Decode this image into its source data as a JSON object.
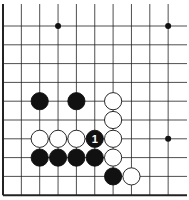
{
  "diagram": {
    "type": "go-board-fragment",
    "colors": {
      "background": "#ffffff",
      "line": "#222222",
      "black": "#111111",
      "white": "#ffffff"
    },
    "grid": {
      "x0": 3,
      "dx": 18.35,
      "cols": 10,
      "y0": 26,
      "dy": 18.8,
      "rows": 10,
      "h_line_extend_to": 187,
      "v_line_top": 4,
      "left_edge": true,
      "bottom_edge": true,
      "top_edge": false,
      "right_edge": false
    },
    "star_points": [
      [
        3,
        0
      ],
      [
        9,
        0
      ],
      [
        9,
        6
      ]
    ],
    "stones": [
      {
        "color": "black",
        "col": 2,
        "row": 4
      },
      {
        "color": "black",
        "col": 4,
        "row": 4
      },
      {
        "color": "white",
        "col": 6,
        "row": 4
      },
      {
        "color": "white",
        "col": 6,
        "row": 5
      },
      {
        "color": "white",
        "col": 2,
        "row": 6
      },
      {
        "color": "white",
        "col": 3,
        "row": 6
      },
      {
        "color": "white",
        "col": 4,
        "row": 6
      },
      {
        "color": "black",
        "col": 5,
        "row": 6,
        "label": "1"
      },
      {
        "color": "white",
        "col": 6,
        "row": 6
      },
      {
        "color": "black",
        "col": 2,
        "row": 7
      },
      {
        "color": "black",
        "col": 3,
        "row": 7
      },
      {
        "color": "black",
        "col": 4,
        "row": 7
      },
      {
        "color": "black",
        "col": 5,
        "row": 7
      },
      {
        "color": "white",
        "col": 6,
        "row": 7
      },
      {
        "color": "black",
        "col": 6,
        "row": 8
      },
      {
        "color": "white",
        "col": 7,
        "row": 8
      }
    ],
    "move_label": "1"
  }
}
